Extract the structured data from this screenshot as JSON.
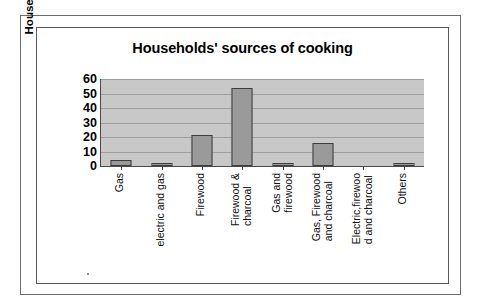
{
  "figure": {
    "frame": "double-rule-border"
  },
  "chart_data": {
    "type": "bar",
    "title": "Households' sources of cooking",
    "xlabel": "",
    "ylabel": "Households (%)",
    "ylim": [
      0,
      60
    ],
    "ytick_labels": [
      "60",
      "50",
      "40",
      "30",
      "20",
      "10",
      "0"
    ],
    "ytick_values": [
      60,
      50,
      40,
      30,
      20,
      10,
      0
    ],
    "grid": true,
    "legend": "none",
    "categories": [
      "Gas",
      "electric and gas",
      "Firewood",
      "Firewood & charcoal",
      "Gas and firewood",
      "Gas, Firewood and charcoal",
      "Electric,firewood and charcoal",
      "Others"
    ],
    "category_label_lines": [
      [
        "Gas"
      ],
      [
        "electric and gas"
      ],
      [
        "Firewood"
      ],
      [
        "Firewood &",
        "charcoal"
      ],
      [
        "Gas and",
        "firewood"
      ],
      [
        "Gas, Firewood",
        "and charcoal"
      ],
      [
        "Electric,firewoo",
        "d and charcoal"
      ],
      [
        "Others"
      ]
    ],
    "values": [
      4,
      1.5,
      21.5,
      54,
      0.8,
      16,
      0,
      1.5
    ],
    "bar_color": "#9a9a9a",
    "bar_edge_color": "#3d3d3d",
    "plot_background": "#c8c8c8",
    "axis_color": "#4a4a4a",
    "gridline_color": "#9e9e9e",
    "text_color": "#000000"
  }
}
